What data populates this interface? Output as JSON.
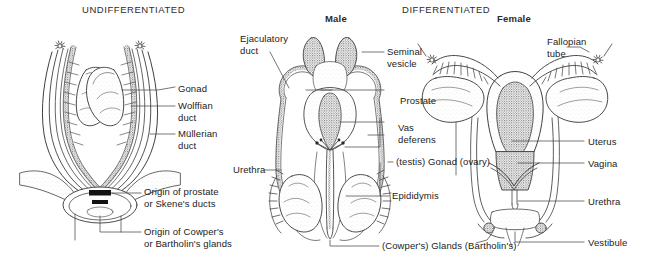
{
  "figure": {
    "width": 658,
    "height": 263,
    "background": "#ffffff",
    "ink": "#3a3a3a",
    "text_color": "#1b1b1b"
  },
  "headers": [
    {
      "id": "undifferentiated",
      "text": "UNDIFFERENTIATED",
      "bold": false,
      "x": 82,
      "y": 4
    },
    {
      "id": "male",
      "text": "Male",
      "bold": true,
      "x": 325,
      "y": 13
    },
    {
      "id": "differentiated",
      "text": "DIFFERENTIATED",
      "bold": false,
      "x": 402,
      "y": 4
    },
    {
      "id": "female",
      "text": "Female",
      "bold": true,
      "x": 497,
      "y": 13
    }
  ],
  "panels": {
    "undifferentiated": {
      "name": "UNDIFFERENTIATED",
      "labels": [
        {
          "id": "gonad",
          "text": "Gonad",
          "x": 178,
          "y": 83
        },
        {
          "id": "wolffian-duct",
          "text": "Wolffian\nduct",
          "x": 178,
          "y": 100
        },
        {
          "id": "mullerian-duct",
          "text": "Müllerian\nduct",
          "x": 178,
          "y": 128
        },
        {
          "id": "origin-of-prostate",
          "text": "Origin of prostate\nor Skene's ducts",
          "x": 144,
          "y": 192
        },
        {
          "id": "origin-of-cowpers",
          "text": "Origin of Cowper's\nor Bartholin's glands",
          "x": 144,
          "y": 228
        }
      ]
    },
    "male": {
      "name": "Male",
      "labels": [
        {
          "id": "ejaculatory-duct",
          "text": "Ejaculatory\nduct",
          "x": 240,
          "y": 33
        },
        {
          "id": "seminal-vesicle",
          "text": "Seminal\nvesicle",
          "x": 387,
          "y": 46
        },
        {
          "id": "prostate",
          "text": "Prostate",
          "x": 400,
          "y": 98
        },
        {
          "id": "vas-deferens",
          "text": "Vas\ndeferens",
          "x": 398,
          "y": 124
        },
        {
          "id": "urethra-male",
          "text": "Urethra",
          "x": 233,
          "y": 163
        },
        {
          "id": "testis-gonad-ovary",
          "text": "(testis) Gonad (ovary)",
          "x": 396,
          "y": 156
        },
        {
          "id": "epididymis",
          "text": "Epididymis",
          "x": 392,
          "y": 186
        },
        {
          "id": "cowpers-glands-bartholins",
          "text": "(Cowper's) Glands (Bartholin's)",
          "x": 382,
          "y": 238
        }
      ]
    },
    "female": {
      "name": "Female",
      "labels": [
        {
          "id": "fallopian-tube",
          "text": "Fallopian\ntube",
          "x": 547,
          "y": 36
        },
        {
          "id": "uterus",
          "text": "Uterus",
          "x": 588,
          "y": 136
        },
        {
          "id": "vagina",
          "text": "Vagina",
          "x": 588,
          "y": 158
        },
        {
          "id": "urethra-female",
          "text": "Urethra",
          "x": 588,
          "y": 196
        },
        {
          "id": "vestibule",
          "text": "Vestibule",
          "x": 588,
          "y": 237
        }
      ]
    }
  }
}
